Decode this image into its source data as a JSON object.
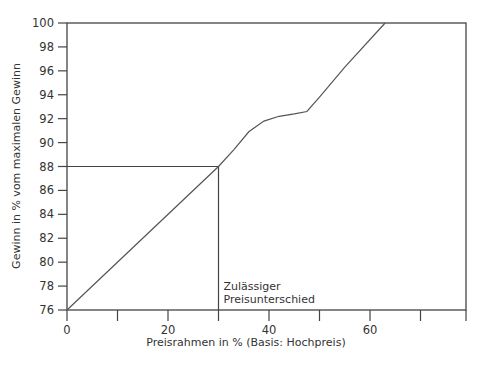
{
  "chart_data": {
    "type": "line",
    "title": "",
    "xlabel": "Preisrahmen in % (Basis: Hochpreis)",
    "ylabel": "Gewinn in % vom maximalen Gewinn",
    "xlim": [
      0,
      79
    ],
    "ylim": [
      76,
      100
    ],
    "x_ticks": [
      0,
      10,
      20,
      30,
      40,
      50,
      60,
      70
    ],
    "x_tick_labels": [
      "0",
      "",
      "20",
      "",
      "40",
      "",
      "60",
      ""
    ],
    "y_ticks": [
      76,
      78,
      80,
      82,
      84,
      86,
      88,
      90,
      92,
      94,
      96,
      98,
      100
    ],
    "y_tick_labels": [
      "76",
      "78",
      "80",
      "82",
      "84",
      "86",
      "88",
      "90",
      "92",
      "94",
      "96",
      "98",
      "100"
    ],
    "grid": false,
    "legend": null,
    "series": [
      {
        "name": "Gewinnkurve",
        "x": [
          0,
          30,
          33,
          36,
          39,
          42,
          45,
          47.5,
          50,
          55,
          63
        ],
        "y": [
          76,
          88,
          89.4,
          90.9,
          91.8,
          92.2,
          92.4,
          92.6,
          93.8,
          96.3,
          100
        ]
      }
    ],
    "reference_lines": [
      {
        "type": "horizontal",
        "y": 88,
        "x_from": 0,
        "x_to": 30
      },
      {
        "type": "vertical",
        "x": 30,
        "y_from": 76,
        "y_to": 88
      }
    ],
    "annotations": [
      {
        "text_line1": "Zulässiger",
        "text_line2": "Preisunterschied",
        "x": 31,
        "y": 77
      }
    ]
  }
}
